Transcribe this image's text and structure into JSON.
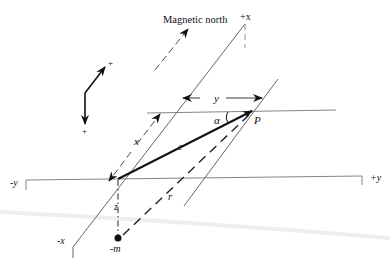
{
  "figure": {
    "labels": {
      "magnetic_north": "Magnetic north",
      "plus_x": "+x",
      "minus_x": "-x",
      "plus_y": "+y",
      "minus_y": "-y",
      "x": "x",
      "y": "y",
      "c": "c",
      "r": "r",
      "z": "z",
      "alpha": "α",
      "P": "P",
      "minus_m": "-m",
      "orient_plus_up": "+",
      "orient_plus_down": "+"
    },
    "colors": {
      "line": "#111111",
      "axis": "#777777",
      "background": "#ffffff"
    }
  }
}
